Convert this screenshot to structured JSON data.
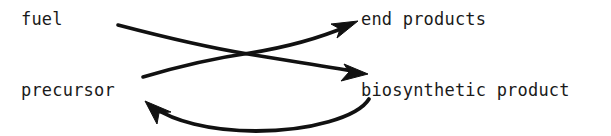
{
  "figure": {
    "background_color": "#ffffff",
    "ink_color": "#111111",
    "text_color": "#1a1a1a"
  },
  "nodes": {
    "fuel": {
      "label": "fuel"
    },
    "end_products": {
      "label": "end products"
    },
    "precursor": {
      "label": "precursor"
    },
    "biosynthetic_product": {
      "label": "biosynthetic product"
    }
  },
  "arrows": [
    {
      "name": "fuel-to-biosynthetic-product",
      "from": "fuel",
      "to": "biosynthetic product",
      "style": "curved",
      "arrowhead": "end"
    },
    {
      "name": "precursor-to-end-products",
      "from": "precursor",
      "to": "end products",
      "style": "curved",
      "arrowhead": "end"
    },
    {
      "name": "biosynthetic-product-to-precursor",
      "from": "biosynthetic product",
      "to": "precursor",
      "style": "curved-arc",
      "arrowhead": "end"
    }
  ]
}
